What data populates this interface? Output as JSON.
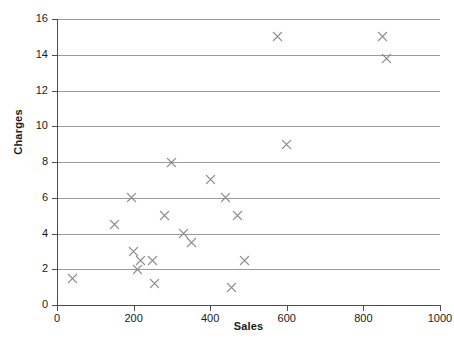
{
  "chart_data": {
    "type": "scatter",
    "title": "",
    "xlabel": "Sales",
    "ylabel": "Charges",
    "xlim": [
      0,
      1000
    ],
    "ylim": [
      0,
      16
    ],
    "xticks": [
      0,
      200,
      400,
      600,
      800,
      1000
    ],
    "yticks": [
      0,
      2,
      4,
      6,
      8,
      10,
      12,
      14,
      16
    ],
    "grid": "horizontal",
    "legend": "none",
    "marker": "x",
    "marker_color": "#8a8a8a",
    "points": [
      {
        "x": 40,
        "y": 1.5
      },
      {
        "x": 150,
        "y": 4.5
      },
      {
        "x": 195,
        "y": 6.0
      },
      {
        "x": 200,
        "y": 3.0
      },
      {
        "x": 210,
        "y": 2.0
      },
      {
        "x": 218,
        "y": 2.5
      },
      {
        "x": 250,
        "y": 2.5
      },
      {
        "x": 255,
        "y": 1.2
      },
      {
        "x": 280,
        "y": 5.0
      },
      {
        "x": 300,
        "y": 8.0
      },
      {
        "x": 330,
        "y": 4.0
      },
      {
        "x": 350,
        "y": 3.5
      },
      {
        "x": 400,
        "y": 7.0
      },
      {
        "x": 440,
        "y": 6.0
      },
      {
        "x": 455,
        "y": 1.0
      },
      {
        "x": 470,
        "y": 5.0
      },
      {
        "x": 490,
        "y": 2.5
      },
      {
        "x": 575,
        "y": 15.0
      },
      {
        "x": 600,
        "y": 9.0
      },
      {
        "x": 850,
        "y": 15.0
      },
      {
        "x": 860,
        "y": 13.8
      }
    ]
  },
  "caption": {
    "text": ""
  }
}
